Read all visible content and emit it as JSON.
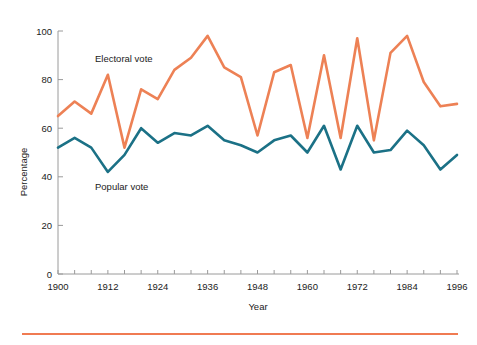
{
  "figure": {
    "background_color": "#ffffff",
    "footer_rule_color": "#f07b52"
  },
  "axes": {
    "x_title": "Year",
    "y_title": "Percentage",
    "x_ticks": [
      "1900",
      "1912",
      "1924",
      "1936",
      "1948",
      "1960",
      "1972",
      "1984",
      "1996"
    ],
    "y_ticks": [
      "0",
      "20",
      "40",
      "60",
      "80",
      "100"
    ]
  },
  "annotations": {
    "electoral_label": "Electoral vote",
    "popular_label": "Popular vote"
  },
  "chart_data": {
    "type": "line",
    "title": "",
    "xlabel": "Year",
    "ylabel": "Percentage",
    "xlim": [
      1900,
      1996
    ],
    "ylim": [
      0,
      100
    ],
    "grid": false,
    "legend_position": "inline-annotation",
    "x": [
      1900,
      1904,
      1908,
      1912,
      1916,
      1920,
      1924,
      1928,
      1932,
      1936,
      1940,
      1944,
      1948,
      1952,
      1956,
      1960,
      1964,
      1968,
      1972,
      1976,
      1980,
      1984,
      1988,
      1992,
      1996
    ],
    "xtick_values": [
      1900,
      1912,
      1924,
      1936,
      1948,
      1960,
      1972,
      1984,
      1996
    ],
    "ytick_values": [
      0,
      20,
      40,
      60,
      80,
      100
    ],
    "series": [
      {
        "name": "Electoral vote",
        "color": "#ed8155",
        "values": [
          65,
          71,
          66,
          82,
          52,
          76,
          72,
          84,
          89,
          98,
          85,
          81,
          57,
          83,
          86,
          56,
          90,
          56,
          97,
          55,
          91,
          98,
          79,
          69,
          70
        ]
      },
      {
        "name": "Popular vote",
        "color": "#1b7186",
        "values": [
          52,
          56,
          52,
          42,
          49,
          60,
          54,
          58,
          57,
          61,
          55,
          53,
          50,
          55,
          57,
          50,
          61,
          43,
          61,
          50,
          51,
          59,
          53,
          43,
          49
        ]
      }
    ]
  }
}
